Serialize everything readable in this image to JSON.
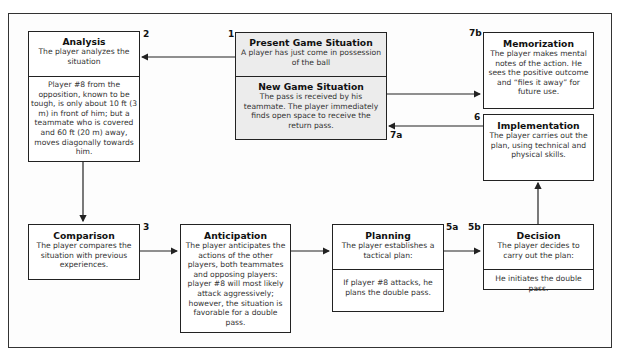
{
  "diagram": {
    "boxes": {
      "present": {
        "number": "1",
        "title": "Present Game Situation",
        "desc": "A player has just come in possession of the ball"
      },
      "new_situation": {
        "title": "New Game Situation",
        "desc": "The pass is received by his teammate. The player immediately finds open space to receive the return pass."
      },
      "analysis": {
        "number": "2",
        "title": "Analysis",
        "desc": "The player analyzes the situation",
        "detail": "Player #8 from the opposition, known to be tough, is only about 10 ft (3 m) in front of him; but a teammate who is covered and 60 ft (20 m) away, moves diagonally towards him."
      },
      "comparison": {
        "number": "3",
        "title": "Comparison",
        "desc": "The player compares the situation with previous experiences."
      },
      "anticipation": {
        "title": "Anticipation",
        "desc": "The player anticipates the actions of the other players, both teammates and opposing players: player #8 will most likely attack aggressively; however, the situation is favorable for a double pass."
      },
      "planning": {
        "number": "5a",
        "title": "Planning",
        "desc": "The player establishes a tactical plan:",
        "detail": "If player #8 attacks, he plans the double pass."
      },
      "decision": {
        "number": "5b",
        "title": "Decision",
        "desc": "The player decides to carry out the plan:",
        "detail": "He initiates the double pass."
      },
      "implementation": {
        "number": "6",
        "title": "Implementation",
        "desc": "The player carries out the plan, using technical and physical skills."
      },
      "memorization": {
        "number": "7b",
        "title": "Memorization",
        "desc": "The player makes mental notes of the action. He sees the positive outcome and “files it away” for future use."
      }
    },
    "labels": {
      "return_arrow": "7a"
    },
    "colors": {
      "line": "#222222",
      "gray_box": "#ececec",
      "white_box": "#ffffff"
    }
  }
}
